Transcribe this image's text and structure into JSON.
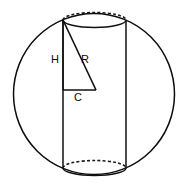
{
  "figure": {
    "background_color": "#ffffff",
    "ink_color": "#101010"
  },
  "labels": {
    "height_leg": "H",
    "radius_hypotenuse": "R",
    "base_leg": "C"
  },
  "shapes": {
    "sphere": {
      "name": "sphere-outline",
      "center_x": 94,
      "center_y": 94,
      "radius": 80.5,
      "stroke": "#0d0d0d",
      "style": "solid"
    },
    "cylinder": {
      "name": "cylinder-body",
      "left_x": 63,
      "right_x": 126,
      "top_y": 20,
      "bottom_y": 168,
      "ellipse_rx": 31.5,
      "ellipse_ry": 7.5,
      "stroke": "#101010"
    },
    "top_ellipse_back": {
      "style": "dashed"
    },
    "top_ellipse_front": {
      "style": "solid"
    },
    "bottom_ellipse_back": {
      "style": "dashed"
    },
    "bottom_ellipse_front": {
      "style": "solid"
    },
    "triangle": {
      "name": "inscribed-right-triangle",
      "apex_x": 63,
      "apex_y": 20,
      "corner_x": 63,
      "corner_y": 90,
      "foot_x": 96,
      "foot_y": 90,
      "stroke": "#101010"
    }
  },
  "label_positions": {
    "height_leg": {
      "x": 55,
      "y": 60
    },
    "radius_hypotenuse": {
      "x": 85,
      "y": 60
    },
    "base_leg": {
      "x": 78,
      "y": 98
    }
  }
}
